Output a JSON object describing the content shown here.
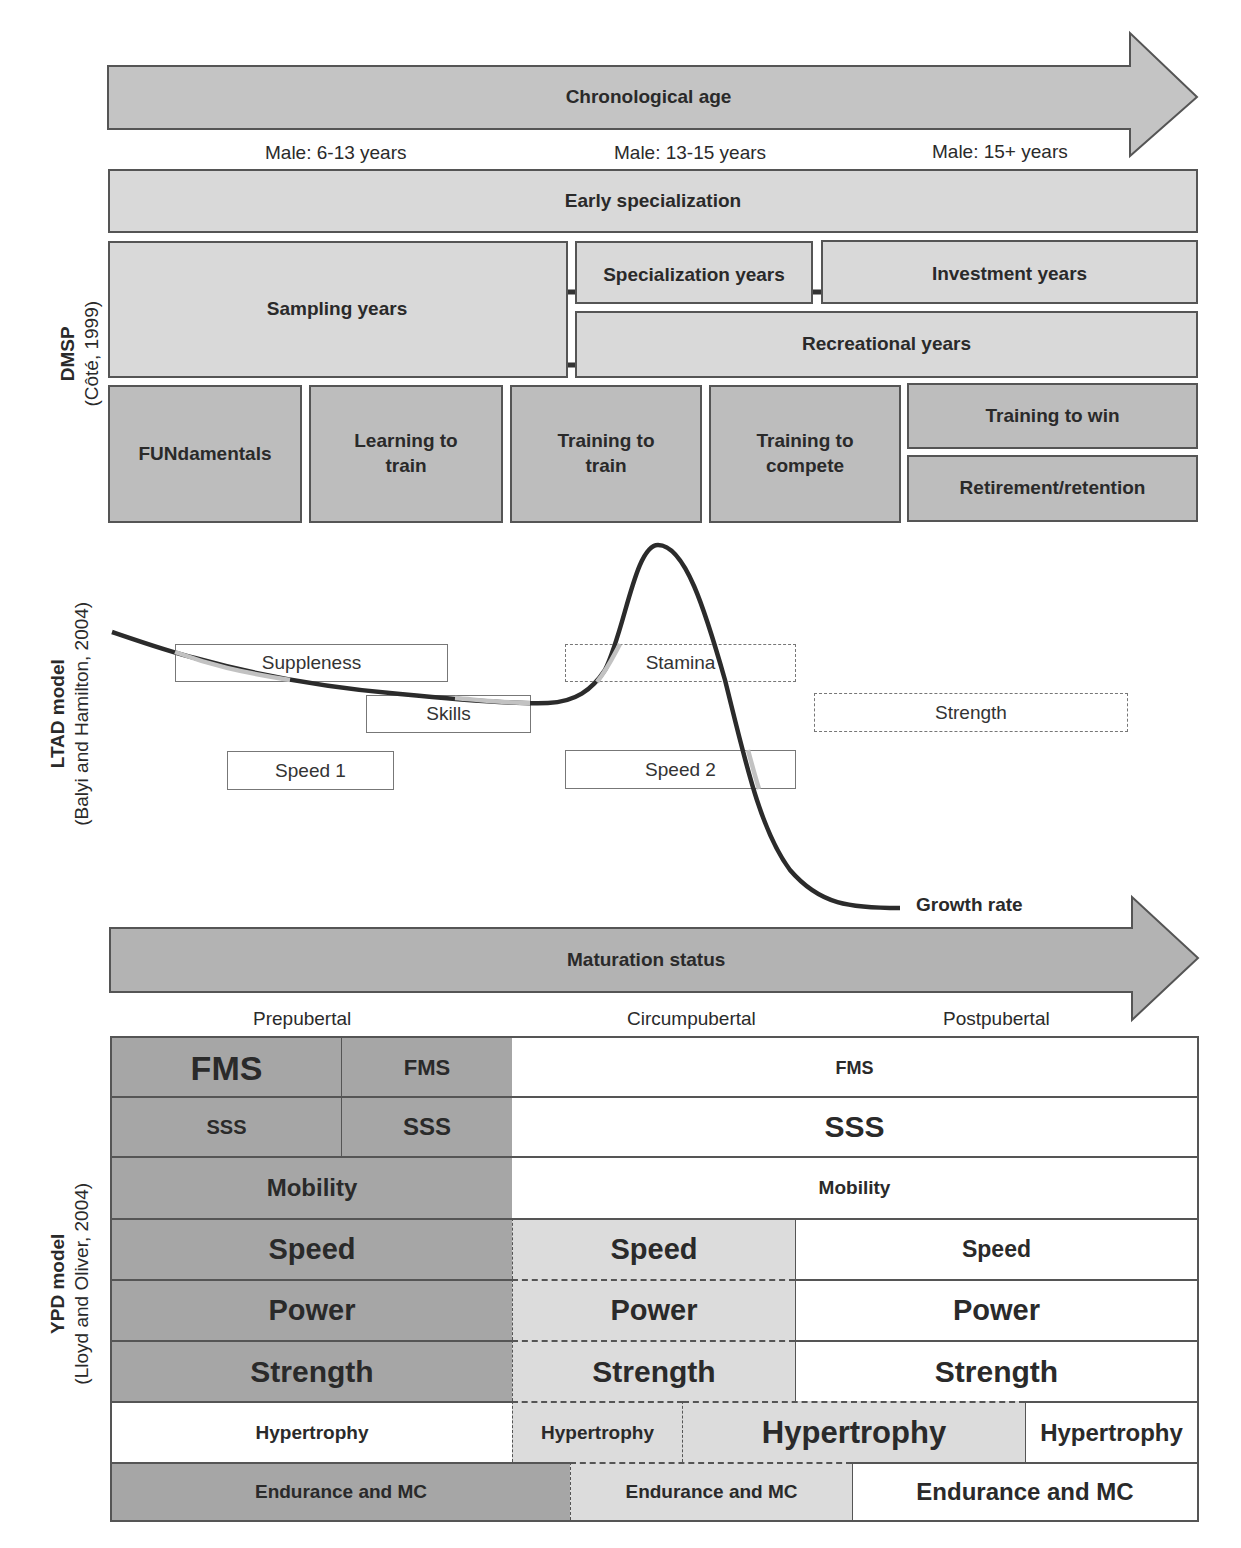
{
  "chronological_age": {
    "title": "Chronological age",
    "age_labels": [
      "Male: 6-13 years",
      "Male: 13-15 years",
      "Male: 15+ years"
    ]
  },
  "dmsp": {
    "side_title": "DMSP",
    "side_citation": "(Côté, 1999)",
    "early_specialization": "Early specialization",
    "sampling_years": "Sampling years",
    "specialization_years": "Specialization years",
    "investment_years": "Investment years",
    "recreational_years": "Recreational years"
  },
  "ltad": {
    "side_title": "LTAD model",
    "side_citation": "(Balyi and Hamilton, 2004)",
    "stages": [
      {
        "label": "FUNdamentals"
      },
      {
        "label": "Learning to train"
      },
      {
        "label": "Training to train"
      },
      {
        "label": "Training to compete"
      },
      {
        "label": "Training to win"
      },
      {
        "label": "Retirement/retention"
      }
    ],
    "windows": {
      "suppleness": "Suppleness",
      "skills": "Skills",
      "speed1": "Speed 1",
      "stamina": "Stamina",
      "speed2": "Speed 2",
      "strength": "Strength"
    },
    "curve_label": "Growth rate"
  },
  "maturation": {
    "title": "Maturation status",
    "labels": [
      "Prepubertal",
      "Circumpubertal",
      "Postpubertal"
    ]
  },
  "ypd": {
    "side_title": "YPD model",
    "side_citation": "(Lloyd and Oliver, 2004)",
    "rows": {
      "fms": [
        "FMS",
        "FMS",
        "FMS"
      ],
      "sss": [
        "SSS",
        "SSS",
        "SSS"
      ],
      "mobility": [
        "Mobility",
        "Mobility"
      ],
      "speed": [
        "Speed",
        "Speed",
        "Speed"
      ],
      "power": [
        "Power",
        "Power",
        "Power"
      ],
      "strength": [
        "Strength",
        "Strength",
        "Strength"
      ],
      "hypertrophy": [
        "Hypertrophy",
        "Hypertrophy",
        "Hypertrophy",
        "Hypertrophy"
      ],
      "endurance": [
        "Endurance and MC",
        "Endurance and MC",
        "Endurance and MC"
      ]
    }
  },
  "colors": {
    "dark_fill": "#a6a6a6",
    "mid_fill": "#bdbdbd",
    "light_fill": "#d9d9d9",
    "border": "#555555",
    "curve": "#2b2b2b",
    "curve_highlight": "#bfbfbf"
  }
}
